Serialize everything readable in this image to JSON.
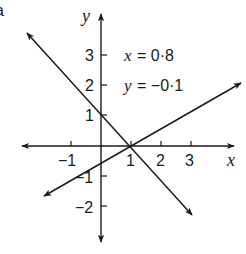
{
  "figure": {
    "part_label": "a",
    "axes": {
      "x_label": "x",
      "y_label": "y",
      "x_ticks": [
        {
          "value": -1,
          "label": "−1"
        },
        {
          "value": 1,
          "label": "1"
        },
        {
          "value": 2,
          "label": "2"
        },
        {
          "value": 3,
          "label": "3"
        }
      ],
      "y_ticks": [
        {
          "value": 3,
          "label": "3"
        },
        {
          "value": 2,
          "label": "2"
        },
        {
          "value": 1,
          "label": "1"
        },
        {
          "value": -1,
          "label": "−1"
        },
        {
          "value": -2,
          "label": "−2"
        }
      ],
      "x_range": [
        -3.1,
        4.7
      ],
      "y_range": [
        -3.5,
        4.3
      ]
    },
    "lines": [
      {
        "name": "descending-line",
        "description": "passes through (0, 1) and (1, 0)",
        "slope": -1.1
      },
      {
        "name": "ascending-line",
        "description": "passes through (1, 0), crosses y-axis near -0.5",
        "slope": 0.57
      }
    ],
    "solution": {
      "x_var": "x",
      "x_value": "= 0·8",
      "y_var": "y",
      "y_value": "= −0·1"
    }
  }
}
